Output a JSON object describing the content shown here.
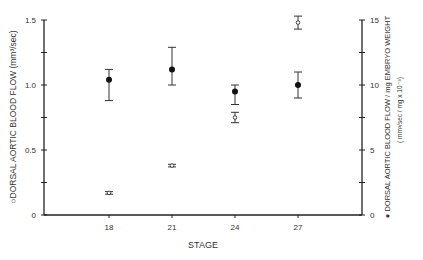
{
  "chart_data": {
    "type": "scatter",
    "title": "",
    "xlabel": "STAGE",
    "ylabel_left": "DORSAL AORTIC BLOOD FLOW (mm³/sec)",
    "ylabel_left_marker": "○",
    "ylabel_right": "DORSAL AORTIC BLOOD FLOW / mg EMBRYO WEIGHT",
    "ylabel_right_units": "( mm³/sec / mg x 10⁻³)",
    "ylabel_right_marker": "●",
    "categories": [
      "18",
      "21",
      "24",
      "27"
    ],
    "x_tick_labels": [
      "18",
      "21",
      "24",
      "27"
    ],
    "ylim_left": [
      0,
      1.5
    ],
    "ylim_right": [
      0,
      15
    ],
    "y_left_ticks": [
      "0",
      "0.5",
      "1.0",
      "1.5"
    ],
    "y_right_ticks": [
      "0",
      "5",
      "10",
      "15"
    ],
    "grid": false,
    "legend": "none (markers indicated in axis labels)",
    "series": [
      {
        "name": "Dorsal aortic blood flow (mm³/sec)",
        "marker": "open",
        "axis": "left",
        "values": [
          0.17,
          0.38,
          0.75,
          1.48
        ],
        "err_low": [
          0.16,
          0.37,
          0.71,
          1.43
        ],
        "err_high": [
          0.18,
          0.39,
          0.79,
          1.53
        ]
      },
      {
        "name": "Dorsal aortic blood flow / mg embryo weight (mm³/sec/mg x 10⁻³)",
        "marker": "filled",
        "axis": "right",
        "values": [
          10.4,
          11.2,
          9.5,
          10.0
        ],
        "err_low": [
          8.8,
          10.0,
          8.5,
          9.0
        ],
        "err_high": [
          11.2,
          12.9,
          10.0,
          11.0
        ]
      }
    ]
  }
}
